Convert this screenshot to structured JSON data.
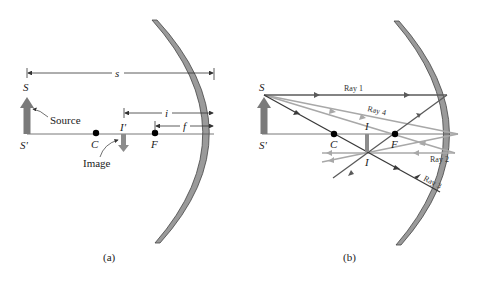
{
  "panel_a": {
    "caption": "(a)",
    "labels": {
      "source_top": "S",
      "source_base": "S'",
      "source_text": "Source",
      "center": "C",
      "focal": "F",
      "image_top": "I'",
      "image_text": "Image",
      "dim_s": "s",
      "dim_i": "i",
      "dim_f": "f"
    }
  },
  "panel_b": {
    "caption": "(b)",
    "labels": {
      "source_top": "S",
      "source_base": "S'",
      "center": "C",
      "focal": "F",
      "image_upper": "I",
      "image_lower": "I",
      "ray1": "Ray 1",
      "ray2": "Ray 2",
      "ray3": "Ray 3",
      "ray4": "Ray 4"
    }
  },
  "colors": {
    "mirror_fill": "#9a9a9a",
    "mirror_edge": "#444444",
    "axis": "#555555",
    "source_arrow": "#7a7a7a",
    "image_arrow": "#8c8c8c",
    "ray_dark": "#4a4a4a",
    "ray_light": "#a8a8a8",
    "dot": "#000000"
  }
}
